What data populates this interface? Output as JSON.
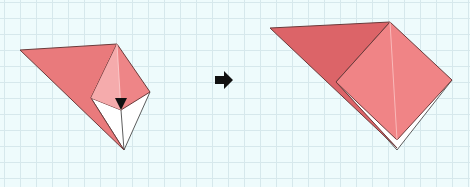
{
  "diagram": {
    "type": "origami-step",
    "steps": [
      {
        "id": "before",
        "description": "Folded model with inner flap; arrow indicates fold down"
      },
      {
        "id": "after",
        "description": "Result after folding flap down into square"
      }
    ],
    "transition_icon": "right-arrow-icon",
    "fold_marker": "fold-down-arrow-icon",
    "colors": {
      "background": "#eefbfc",
      "grid": "#d6e8ec",
      "paper_dark": "#e06b6e",
      "paper_mid": "#ee8587",
      "paper_light": "#f5a9aa",
      "paper_back": "#ffffff",
      "edge": "#6b3b3b",
      "arrow": "#111111"
    }
  }
}
